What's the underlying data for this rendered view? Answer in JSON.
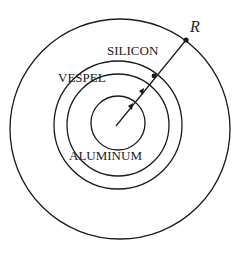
{
  "diagram": {
    "labels": {
      "silicon": "SILICON",
      "vespel": "VESPEL",
      "aluminum": "ALUMINUM",
      "radius": "R"
    },
    "layers": [
      "ALUMINUM",
      "VESPEL",
      "SILICON"
    ],
    "line_color": "#1a1a1a"
  }
}
